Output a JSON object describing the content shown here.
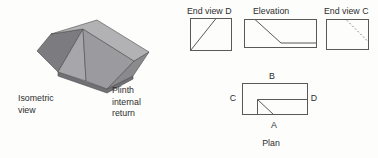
{
  "palette": {
    "background": "#fdfdfc",
    "line_color": "#59595b",
    "text_color": "#2d2d2f",
    "iso_top_face": "#b2b2b5",
    "iso_splay_face": "#9b9b9f",
    "iso_return_face": "#a7a7ab",
    "iso_left_end_face": "#7c7c80",
    "iso_right_end_face": "#8a8a8e",
    "iso_bottom_lip_face": "#717175",
    "iso_outline": "#4b4b4d"
  },
  "isometric": {
    "label_line1": "Isometric",
    "label_line2": "view",
    "part_label_line1": "Plinth",
    "part_label_line2": "internal",
    "part_label_line3": "return"
  },
  "views": {
    "end_view_d": {
      "title": "End view D"
    },
    "elevation": {
      "title": "Elevation"
    },
    "end_view_c": {
      "title": "End view C"
    },
    "plan": {
      "title": "Plan",
      "marker_top": "B",
      "marker_left": "C",
      "marker_right": "D",
      "marker_bottom": "A"
    }
  }
}
